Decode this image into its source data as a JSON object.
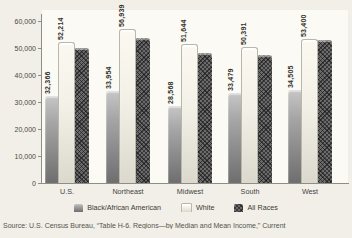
{
  "chart_data": {
    "type": "bar",
    "title": "",
    "categories": [
      "U.S.",
      "Northeast",
      "Midwest",
      "South",
      "West"
    ],
    "series": [
      {
        "name": "Black/African American",
        "values": [
          32366,
          33954,
          28568,
          33479,
          34505
        ],
        "value_labels": [
          "32,366",
          "33,954",
          "28,568",
          "33,479",
          "34,505"
        ],
        "labeled": true
      },
      {
        "name": "White",
        "values": [
          52214,
          56939,
          51644,
          50391,
          53400
        ],
        "value_labels": [
          "52,214",
          "56,939",
          "51,644",
          "50,391",
          "53,400"
        ],
        "labeled": true
      },
      {
        "name": "All Races",
        "values": [
          49900,
          53700,
          48200,
          47400,
          53100
        ],
        "value_labels": [
          "",
          "",
          "",
          "",
          ""
        ],
        "labeled": false
      }
    ],
    "ylim": [
      0,
      60000
    ],
    "ytick_values": [
      0,
      10000,
      20000,
      30000,
      40000,
      50000,
      60000
    ],
    "ytick_labels": [
      "0",
      "10,000",
      "20,000",
      "30,000",
      "40,000",
      "50,000",
      "60,000"
    ],
    "grid": false,
    "legend_position": "bottom"
  },
  "source_line": "Source: U.S. Census Bureau, “Table H-6. Regions—by Median and Mean Income,” Current",
  "colors": {
    "black_bar": "#8e8e8e",
    "white_bar": "#f3f1e8",
    "all_races_bar": "#6b6b6b",
    "axis": "#8f8d86",
    "page_bg": "#f1efe8",
    "plot_bg": "#fbfaf4"
  }
}
